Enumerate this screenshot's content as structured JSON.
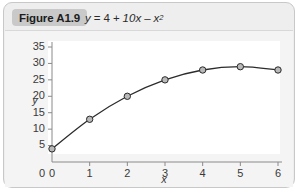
{
  "figure": {
    "badge_label": "Figure A1.9",
    "equation": {
      "lhs": "y",
      "eq": "=",
      "term1": "4",
      "op1": "+",
      "term2": "10x",
      "op2": "–",
      "term3": "x",
      "exponent": "2"
    }
  },
  "chart_data": {
    "type": "line",
    "title": "",
    "subtitle": "",
    "xlabel": "x",
    "ylabel": "y",
    "xlim": [
      0,
      6
    ],
    "ylim": [
      0,
      35
    ],
    "grid": false,
    "legend": "none",
    "x": [
      0,
      1,
      2,
      3,
      4,
      5,
      6
    ],
    "values": [
      4,
      13,
      20,
      25,
      28,
      29,
      28
    ],
    "series": [
      {
        "name": "y = 4 + 10x - x^2",
        "values": [
          4,
          13,
          20,
          25,
          28,
          29,
          28
        ]
      }
    ],
    "x_tick_labels": [
      "0",
      "1",
      "2",
      "3",
      "4",
      "5",
      "6"
    ],
    "y_tick_labels": [
      "0",
      "5",
      "10",
      "15",
      "20",
      "25",
      "30",
      "35"
    ],
    "y_ticks": [
      5,
      10,
      15,
      20,
      25,
      30,
      35
    ],
    "y_origin_label": "0",
    "marker": "circle",
    "marker_fill": "#b9b9b9",
    "marker_edge": "#2b2b2b",
    "line_color": "#2b2b2b",
    "axis_color": "#8a8a8a",
    "plot_background": "#ffffff"
  }
}
